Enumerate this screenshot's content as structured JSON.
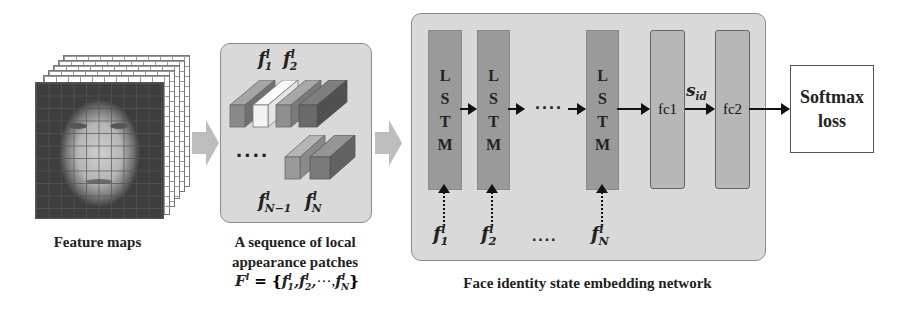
{
  "feature_maps": {
    "caption": "Feature maps",
    "layers": 6
  },
  "patches": {
    "top_labels": [
      {
        "base": "f",
        "sup": "l",
        "sub": "1"
      },
      {
        "base": "f",
        "sup": "l",
        "sub": "2"
      }
    ],
    "ellipsis": "····",
    "bottom_labels": [
      {
        "base": "f",
        "sup": "l",
        "sub": "N−1"
      },
      {
        "base": "f",
        "sup": "l",
        "sub": "N"
      }
    ],
    "caption_line1": "A sequence of local",
    "caption_line2": "appearance patches",
    "formula": {
      "lhs_base": "F",
      "lhs_sup": "l",
      "eq": " = {",
      "items": [
        {
          "base": "f",
          "sup": "l",
          "sub": "1"
        },
        {
          "base": "f",
          "sup": "l",
          "sub": "2"
        }
      ],
      "ellipsis": "···",
      "last": {
        "base": "f",
        "sup": "l",
        "sub": "N"
      },
      "close": "}"
    },
    "bar_colors": [
      "#8a8a8a",
      "#f3f3f3",
      "#8f8f8f",
      "#6a6a6a"
    ],
    "bottom_bar_colors": [
      "#9a9a9a",
      "#7a7a7a"
    ]
  },
  "network": {
    "caption": "Face identity state embedding network",
    "lstm_letters": [
      "L",
      "S",
      "T",
      "M"
    ],
    "lstm_inputs": [
      {
        "base": "f",
        "sup": "l",
        "sub": "1"
      },
      {
        "base": "f",
        "sup": "l",
        "sub": "2"
      },
      {
        "base": "f",
        "sup": "l",
        "sub": "N"
      }
    ],
    "ellipsis_mid": "····",
    "ellipsis_bottom": "····",
    "fc1_label": "fc1",
    "fc2_label": "fc2",
    "sid_label": {
      "base": "s",
      "sub": "id"
    }
  },
  "loss": {
    "line1": "Softmax",
    "line2": "loss"
  },
  "colors": {
    "panel_bg": "#d9d9d9",
    "panel_border": "#8c8c8c",
    "lstm_fill": "#9a9a9a",
    "fc_fill": "#b7b7b7",
    "gray_arrow": "#bdbdbd"
  }
}
